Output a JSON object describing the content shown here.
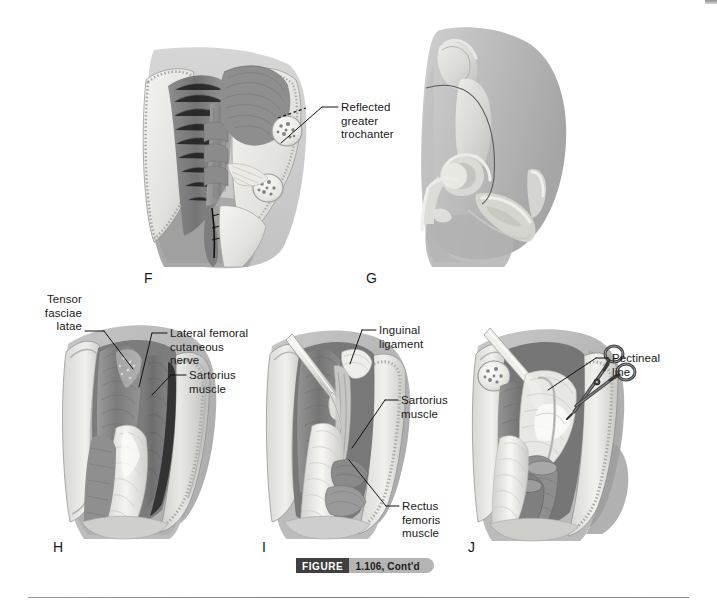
{
  "figure": {
    "word": "FIGURE",
    "number": "1.106, Cont'd"
  },
  "panels": [
    {
      "id": "F",
      "letter": "F",
      "description": "Lateral hip dissection with reflected greater trochanter, gluteal musculature retracted and cut bone ends exposed"
    },
    {
      "id": "G",
      "letter": "G",
      "description": "Ghosted lateral view of hip bone and proximal femur showing skeletal landmarks and incision line"
    },
    {
      "id": "H",
      "letter": "H",
      "description": "Anterior thigh dissection, superficial layer with skin flaps retracted exposing tensor fasciae latae and sartorius"
    },
    {
      "id": "I",
      "letter": "I",
      "description": "Deeper anterior dissection with retractor showing inguinal ligament, sartorius and rectus femoris"
    },
    {
      "id": "J",
      "letter": "J",
      "description": "Deep anterior dissection with surgical scissors dividing tissue at the pectineal line"
    }
  ],
  "labels": [
    {
      "id": "reflected-greater-trochanter",
      "text": "Reflected\ngreater\ntrochanter",
      "panel": "F"
    },
    {
      "id": "tensor-fasciae-latae",
      "text": "Tensor\nfasciae\nlatae",
      "panel": "H"
    },
    {
      "id": "lateral-femoral-cutaneous-nerve",
      "text": "Lateral femoral\ncutaneous\nnerve",
      "panel": "H"
    },
    {
      "id": "sartorius-muscle-h",
      "text": "Sartorius\nmuscle",
      "panel": "H"
    },
    {
      "id": "inguinal-ligament",
      "text": "Inguinal\nligament",
      "panel": "I"
    },
    {
      "id": "sartorius-muscle-i",
      "text": "Sartorius\nmuscle",
      "panel": "I"
    },
    {
      "id": "rectus-femoris-muscle",
      "text": "Rectus\nfemoris\nmuscle",
      "panel": "I"
    },
    {
      "id": "pectineal-line",
      "text": "Pectineal\nline",
      "panel": "J"
    }
  ],
  "colors": {
    "caption_word_bg": "#3f3f3f",
    "caption_num_bg": "#b4b4b4",
    "label_text": "#1a1a1a",
    "leader_line": "#111111",
    "page_bg": "#ffffff",
    "tissue_mid": "#9a9a9a",
    "tissue_dark": "#6e6e6e",
    "tissue_light": "#d8d8d8",
    "bone_white": "#f2f2ee"
  }
}
